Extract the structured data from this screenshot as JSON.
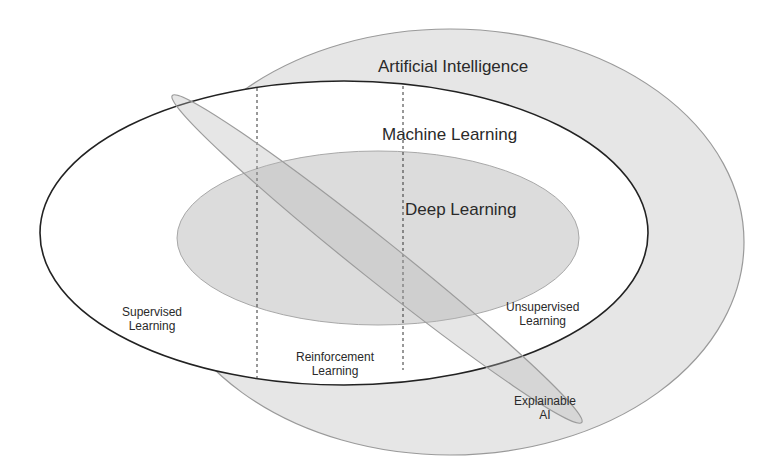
{
  "diagram": {
    "type": "nested-venn",
    "colors": {
      "background": "#ffffff",
      "ai_fill": "#e6e6e6",
      "ai_stroke": "#9a9a9a",
      "ml_fill": "#ffffff",
      "ml_stroke": "#222222",
      "dl_fill": "#dcdcdc",
      "dl_stroke": "#a8a8a8",
      "xai_fill": "#d4d4d4",
      "xai_stroke": "#a0a0a0",
      "text": "#2a2a2a"
    },
    "regions": {
      "ai": {
        "label": "Artificial Intelligence"
      },
      "ml": {
        "label": "Machine Learning"
      },
      "dl": {
        "label": "Deep Learning"
      },
      "xai": {
        "label_line1": "Explainable",
        "label_line2": "AI"
      }
    },
    "ml_partitions": [
      {
        "label_line1": "Supervised",
        "label_line2": "Learning"
      },
      {
        "label_line1": "Reinforcement",
        "label_line2": "Learning"
      },
      {
        "label_line1": "Unsupervised",
        "label_line2": "Learning"
      }
    ]
  }
}
